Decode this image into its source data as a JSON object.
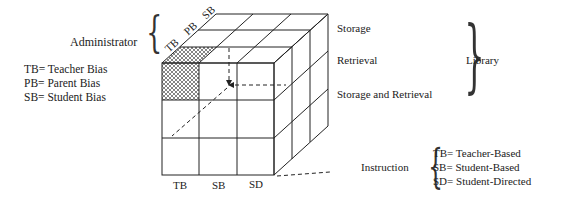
{
  "diagram": {
    "cube": {
      "front_face_axis": {
        "label": "Instruction",
        "columns": [
          "TB",
          "SB",
          "SD"
        ],
        "legend": [
          "TB= Teacher-Based",
          "SB= Student-Based",
          "SD= Student-Directed"
        ]
      },
      "depth_axis": {
        "label": "Administrator",
        "columns": [
          "TB",
          "PB",
          "SB"
        ],
        "legend": [
          "TB= Teacher Bias",
          "PB= Parent Bias",
          "SB= Student Bias"
        ]
      },
      "row_axis": {
        "label": "Library",
        "rows": [
          "Storage",
          "Retrieval",
          "Storage and Retrieval"
        ]
      },
      "highlighted_cell": "TB / TB / Storage",
      "line_color": "#222222",
      "hatch_color": "#333333"
    }
  }
}
